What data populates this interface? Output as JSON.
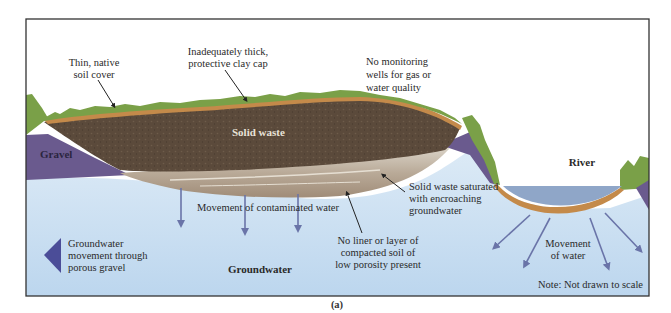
{
  "figure": {
    "caption": "(a)",
    "note": "Note: Not drawn to scale"
  },
  "labels": {
    "thin_soil": [
      "Thin, native",
      "soil cover"
    ],
    "clay_cap": [
      "Inadequately thick,",
      "protective clay cap"
    ],
    "no_monitoring": [
      "No monitoring",
      "wells for gas or",
      "water quality"
    ],
    "solid_waste": "Solid waste",
    "gravel": "Gravel",
    "river": "River",
    "saturated": [
      "Solid waste saturated",
      "with encroaching",
      "groundwater"
    ],
    "contaminated": "Movement of contaminated water",
    "no_liner": [
      "No liner or layer of",
      "compacted soil of",
      "low porosity present"
    ],
    "groundwater_movement": [
      "Groundwater",
      "movement through",
      "porous gravel"
    ],
    "groundwater": "Groundwater",
    "movement_of_water": [
      "Movement",
      "of water"
    ]
  },
  "colors": {
    "sky": "#ffffff",
    "groundwater": "#c9dff0",
    "groundwater_light": "#dfeaf5",
    "waste": "#5a4a3c",
    "clay": "#c48a4a",
    "grass": "#7aa048",
    "gravel": "#6a5a8e",
    "river_water": "#8fa6c8",
    "arrow": "#6a74a8",
    "frame": "#333333"
  }
}
